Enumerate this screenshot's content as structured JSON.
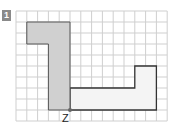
{
  "exercise": {
    "number": "1",
    "point_label": "Z"
  },
  "grid": {
    "cols": 14,
    "rows": 10,
    "origin_x": 16,
    "origin_y": 11,
    "cell_w": 10.8,
    "cell_h": 11,
    "line_color": "#cfcfcf"
  },
  "shapes": {
    "shaded_l": {
      "fill": "#d0d0d0",
      "stroke": "#555555",
      "points_cells": [
        [
          1,
          1
        ],
        [
          5,
          1
        ],
        [
          5,
          9
        ],
        [
          3,
          9
        ],
        [
          3,
          3
        ],
        [
          1,
          3
        ]
      ]
    },
    "outline_shape": {
      "fill": "#f4f4f4",
      "stroke": "#333333",
      "points_cells": [
        [
          5,
          7
        ],
        [
          11,
          7
        ],
        [
          11,
          5
        ],
        [
          13,
          5
        ],
        [
          13,
          9
        ],
        [
          5,
          9
        ]
      ]
    }
  },
  "colors": {
    "badge": "#8a8a8a",
    "point": "#666666"
  }
}
